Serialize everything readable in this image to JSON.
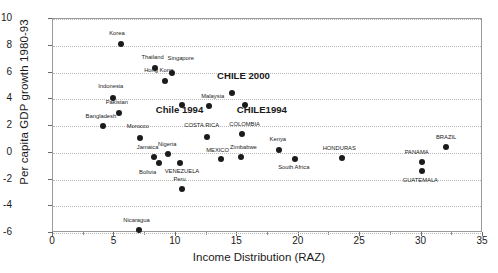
{
  "chart": {
    "type": "scatter",
    "title": "",
    "xlabel": "Income Distribution (RAZ)",
    "ylabel": "Per capita GDP growth 1980-93",
    "xlim": [
      0,
      35
    ],
    "ylim": [
      -6,
      10
    ],
    "xticks": [
      "0",
      "5",
      "10",
      "15",
      "20",
      "25",
      "30",
      "35"
    ],
    "yticks": [
      "10",
      "8",
      "6",
      "4",
      "2",
      "0",
      "-2",
      "-4",
      "-6"
    ],
    "grid": "horizontal-dotted",
    "legend": "none"
  },
  "chart_data": {
    "type": "scatter",
    "title": "",
    "xlabel": "Income Distribution (RAZ)",
    "ylabel": "Per capita GDP growth 1980-93",
    "xlim": [
      0,
      35
    ],
    "ylim": [
      -6,
      10
    ],
    "xticks": [
      0,
      5,
      10,
      15,
      20,
      25,
      30,
      35
    ],
    "yticks": [
      -6,
      -4,
      -2,
      0,
      2,
      4,
      6,
      8,
      10
    ],
    "grid": true,
    "legend_position": "none",
    "marker": "filled-circle",
    "marker_color": "#1b1b1b",
    "points": [
      {
        "label": "Korea",
        "x": 5.5,
        "y": 8.1,
        "emphasis": false,
        "lx": 5.2,
        "ly": 8.9
      },
      {
        "label": "Thailand",
        "x": 8.3,
        "y": 6.3,
        "emphasis": false,
        "lx": 8.1,
        "ly": 7.1
      },
      {
        "label": "Singapore",
        "x": 9.7,
        "y": 6.0,
        "emphasis": false,
        "lx": 10.4,
        "ly": 7.0
      },
      {
        "label": "Hong Kong",
        "x": 9.1,
        "y": 5.4,
        "emphasis": false,
        "lx": 8.6,
        "ly": 6.1
      },
      {
        "label": "CHILE 2000",
        "x": 14.6,
        "y": 4.5,
        "emphasis": true,
        "lx": 15.5,
        "ly": 5.7
      },
      {
        "label": "Indonesia",
        "x": 4.9,
        "y": 4.1,
        "emphasis": false,
        "lx": 4.7,
        "ly": 4.9
      },
      {
        "label": "Malaysia",
        "x": 12.7,
        "y": 3.5,
        "emphasis": false,
        "lx": 13.0,
        "ly": 4.2
      },
      {
        "label": "CHILE1994",
        "x": 15.6,
        "y": 3.6,
        "emphasis": true,
        "lx": 17.0,
        "ly": 3.1
      },
      {
        "label": "Chile 1994",
        "x": 10.5,
        "y": 3.6,
        "emphasis": true,
        "lx": 10.3,
        "ly": 3.1
      },
      {
        "label": "Pakistan",
        "x": 5.4,
        "y": 3.0,
        "emphasis": false,
        "lx": 5.2,
        "ly": 3.7
      },
      {
        "label": "Bangladesh",
        "x": 4.1,
        "y": 2.0,
        "emphasis": false,
        "lx": 3.9,
        "ly": 2.7
      },
      {
        "label": "COSTA RICA",
        "x": 12.5,
        "y": 1.2,
        "emphasis": false,
        "lx": 12.1,
        "ly": 2.0
      },
      {
        "label": "COLOMBIA",
        "x": 15.4,
        "y": 1.4,
        "emphasis": false,
        "lx": 15.6,
        "ly": 2.1
      },
      {
        "label": "BRAZIL",
        "x": 32.0,
        "y": 0.4,
        "emphasis": false,
        "lx": 32.0,
        "ly": 1.1
      },
      {
        "label": "Morocco",
        "x": 7.1,
        "y": 1.1,
        "emphasis": false,
        "lx": 6.9,
        "ly": 1.9
      },
      {
        "label": "Jamaica",
        "x": 8.2,
        "y": -0.3,
        "emphasis": false,
        "lx": 7.7,
        "ly": 0.35
      },
      {
        "label": "Nigeria",
        "x": 9.4,
        "y": -0.1,
        "emphasis": false,
        "lx": 9.3,
        "ly": 0.55
      },
      {
        "label": "MEXICO",
        "x": 13.7,
        "y": -0.5,
        "emphasis": false,
        "lx": 13.4,
        "ly": 0.1
      },
      {
        "label": "Zimbabwe",
        "x": 15.3,
        "y": -0.3,
        "emphasis": false,
        "lx": 15.5,
        "ly": 0.35
      },
      {
        "label": "Kenya",
        "x": 18.4,
        "y": 0.2,
        "emphasis": false,
        "lx": 18.3,
        "ly": 0.95
      },
      {
        "label": "HONDURAS",
        "x": 23.5,
        "y": -0.4,
        "emphasis": false,
        "lx": 23.3,
        "ly": 0.25
      },
      {
        "label": "South Africa",
        "x": 19.7,
        "y": -0.5,
        "emphasis": false,
        "lx": 19.6,
        "ly": -1.15
      },
      {
        "label": "Bolivia",
        "x": 8.6,
        "y": -0.8,
        "emphasis": false,
        "lx": 7.7,
        "ly": -1.5
      },
      {
        "label": "VENEZUELA",
        "x": 10.3,
        "y": -0.8,
        "emphasis": false,
        "lx": 10.5,
        "ly": -1.45
      },
      {
        "label": "PANAMA",
        "x": 30.0,
        "y": -0.7,
        "emphasis": false,
        "lx": 29.6,
        "ly": -0.05
      },
      {
        "label": "GUATEMALA",
        "x": 30.0,
        "y": -1.4,
        "emphasis": false,
        "lx": 29.9,
        "ly": -2.1
      },
      {
        "label": "Peru",
        "x": 10.5,
        "y": -2.7,
        "emphasis": false,
        "lx": 10.3,
        "ly": -2.0
      },
      {
        "label": "Nicaragua",
        "x": 7.0,
        "y": -5.8,
        "emphasis": false,
        "lx": 6.8,
        "ly": -5.1
      }
    ]
  }
}
